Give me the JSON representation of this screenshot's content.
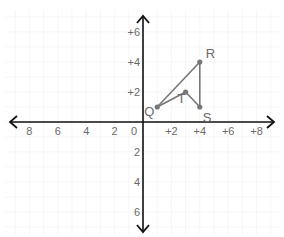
{
  "diagram": {
    "type": "coordinate-plane",
    "origin_label": "0",
    "x_ticks": [
      {
        "value": -8,
        "label": "8"
      },
      {
        "value": -6,
        "label": "6"
      },
      {
        "value": -4,
        "label": "4"
      },
      {
        "value": -2,
        "label": "2"
      },
      {
        "value": 2,
        "label": "+2"
      },
      {
        "value": 4,
        "label": "+4"
      },
      {
        "value": 6,
        "label": "+6"
      },
      {
        "value": 8,
        "label": "+8"
      }
    ],
    "y_ticks": [
      {
        "value": 6,
        "label": "+6"
      },
      {
        "value": 4,
        "label": "+4"
      },
      {
        "value": 2,
        "label": "+2"
      },
      {
        "value": -2,
        "label": "2"
      },
      {
        "value": -4,
        "label": "4"
      },
      {
        "value": -6,
        "label": "6"
      }
    ],
    "points": [
      {
        "name": "Q",
        "x": 1,
        "y": 1
      },
      {
        "name": "R",
        "x": 4,
        "y": 4
      },
      {
        "name": "S",
        "x": 4,
        "y": 1
      },
      {
        "name": "T",
        "x": 3,
        "y": 2
      }
    ],
    "segments": [
      [
        "Q",
        "R"
      ],
      [
        "R",
        "S"
      ],
      [
        "S",
        "T"
      ],
      [
        "T",
        "Q"
      ]
    ],
    "colors": {
      "axis": "#111111",
      "shape": "#777777",
      "grid": "#f0f0f0",
      "text": "#6a6a6a"
    }
  }
}
